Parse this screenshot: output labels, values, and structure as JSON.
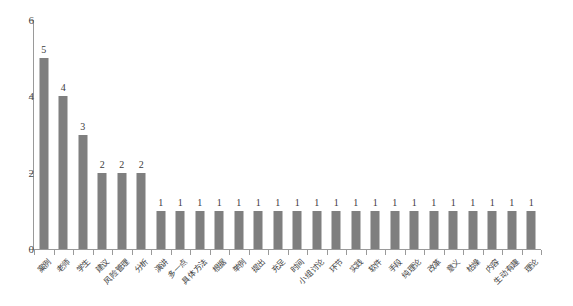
{
  "chart_data": {
    "type": "bar",
    "title": "",
    "xlabel": "",
    "ylabel": "",
    "ylim": [
      0,
      6
    ],
    "yticks": [
      0,
      2,
      4,
      6
    ],
    "grid": false,
    "legend": "none",
    "bar_color": "#7f7f7f",
    "axis_color": "#9a9a9a",
    "categories": [
      "案例",
      "老师",
      "学生",
      "建议",
      "风险管理",
      "分析",
      "演讲",
      "多一点",
      "具体方法",
      "根据",
      "举例",
      "提出",
      "充足",
      "时间",
      "小组讨论",
      "环节",
      "实践",
      "软件",
      "手段",
      "纯理论",
      "改革",
      "意义",
      "枯燥",
      "内容",
      "生动有趣",
      "理论"
    ],
    "values": [
      5,
      4,
      3,
      2,
      2,
      2,
      1,
      1,
      1,
      1,
      1,
      1,
      1,
      1,
      1,
      1,
      1,
      1,
      1,
      1,
      1,
      1,
      1,
      1,
      1,
      1
    ],
    "value_labels": [
      "5",
      "4",
      "3",
      "2",
      "2",
      "2",
      "1",
      "1",
      "1",
      "1",
      "1",
      "1",
      "1",
      "1",
      "1",
      "1",
      "1",
      "1",
      "1",
      "1",
      "1",
      "1",
      "1",
      "1",
      "1",
      "1"
    ],
    "ytick_labels": [
      "0",
      "2",
      "4",
      "6"
    ]
  }
}
